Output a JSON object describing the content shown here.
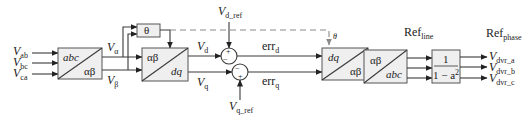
{
  "diagram": {
    "inputs": [
      {
        "main": "V",
        "sub": "ab"
      },
      {
        "main": "V",
        "sub": "bc"
      },
      {
        "main": "V",
        "sub": "ca"
      }
    ],
    "blocks": {
      "abc_to_ab": {
        "top": "abc",
        "bottom": "αβ"
      },
      "theta": {
        "label": "θ"
      },
      "ab_to_dq": {
        "top": "αβ",
        "bottom": "dq"
      },
      "dq_to_ab": {
        "top": "dq",
        "bottom": "αβ"
      },
      "ab_to_abc": {
        "top": "αβ",
        "bottom": "abc"
      },
      "scale": {
        "numerator": "1",
        "denominator": "1 − a",
        "exp": "2"
      }
    },
    "signals": {
      "v_alpha": {
        "main": "V",
        "sub": "α"
      },
      "v_beta": {
        "main": "V",
        "sub": "β"
      },
      "v_d": {
        "main": "V",
        "sub": "d"
      },
      "v_q": {
        "main": "V",
        "sub": "q"
      },
      "v_d_ref": {
        "main": "V",
        "sub": "d_ref"
      },
      "v_q_ref": {
        "main": "V",
        "sub": "q_ref"
      },
      "err_d_1": {
        "main": "err",
        "sub": "d"
      },
      "err_q_1": {
        "main": "err",
        "sub": "q"
      },
      "err_d_2": {
        "main": "err",
        "sub": "d"
      },
      "err_q_2": {
        "main": "err",
        "sub": "q"
      },
      "theta_fb": "θ",
      "ref_line": {
        "main": "Ref",
        "sub": "line"
      },
      "ref_phase": {
        "main": "Ref",
        "sub": "phase"
      }
    },
    "summers": {
      "d": {
        "top_sign": "+",
        "left_sign": "−"
      },
      "q": {
        "left_sign": "−",
        "bottom_sign": "+"
      }
    },
    "outputs": [
      {
        "main": "V",
        "sub": "dvr_a"
      },
      {
        "main": "V",
        "sub": "dvr_b"
      },
      {
        "main": "V",
        "sub": "dvr_c"
      }
    ]
  }
}
